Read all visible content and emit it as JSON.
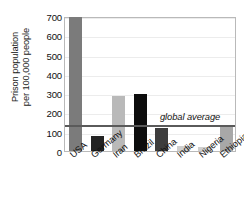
{
  "chart_data": {
    "type": "bar",
    "title": "",
    "xlabel": "",
    "ylabel": "Prison population per 100,000 people",
    "ylabel_line1": "Prison population",
    "ylabel_line2": "per 100,000 people",
    "categories": [
      "USA",
      "Germany",
      "Iran",
      "Brazil",
      "China",
      "India",
      "Nigeria",
      "Ethiopia"
    ],
    "values": [
      693,
      76,
      284,
      296,
      118,
      26,
      23,
      123
    ],
    "bar_colors": [
      "#7b7b7b",
      "#232323",
      "#b9b9b9",
      "#0d0d0d",
      "#3d3d3d",
      "#cfcfcf",
      "#cfcfcf",
      "#a8a8a8"
    ],
    "ylim": [
      0,
      700
    ],
    "yticks": [
      0,
      100,
      200,
      300,
      400,
      500,
      600,
      700
    ],
    "ytick_labels": [
      "0",
      "100",
      "200",
      "300",
      "400",
      "500",
      "600",
      "700"
    ],
    "grid": true,
    "legend": "none",
    "annotations": [
      {
        "name": "global-average",
        "label": "global average",
        "value": 145,
        "style": "horizontal-line",
        "color": "#5a5a5a"
      }
    ]
  }
}
